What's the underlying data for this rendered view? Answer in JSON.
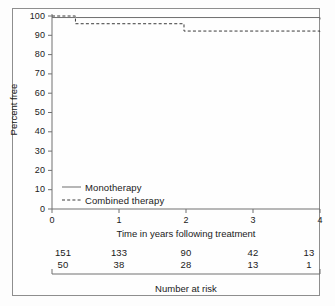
{
  "figure": {
    "caption_bottom": "Number at risk"
  },
  "chart_data": {
    "type": "line",
    "subtype": "kaplan-meier-step",
    "title": "",
    "xlabel": "Time in years following treatment",
    "ylabel": "Percent free",
    "xlim": [
      0,
      4
    ],
    "ylim": [
      0,
      100
    ],
    "xticks": [
      "0",
      "1",
      "2",
      "3",
      "4"
    ],
    "yticks": [
      "0",
      "10",
      "20",
      "30",
      "40",
      "50",
      "60",
      "70",
      "80",
      "90",
      "100"
    ],
    "grid": false,
    "legend_position": "inside-lower-left",
    "series": [
      {
        "name": "Monotherapy",
        "style": "solid",
        "color": "#6f6f6f",
        "steps_x": [
          0,
          0.35,
          4
        ],
        "steps_y": [
          99.2,
          99.2,
          98.2
        ]
      },
      {
        "name": "Combined therapy",
        "style": "dashed",
        "color": "#3a3a3a",
        "steps_x": [
          0,
          0.35,
          1.97,
          4
        ],
        "steps_y": [
          100,
          96.0,
          92.2,
          92.0
        ]
      }
    ],
    "risk_table": {
      "times": [
        "0",
        "1",
        "2",
        "3",
        "4"
      ],
      "rows": [
        {
          "series": "Monotherapy",
          "values": [
            "151",
            "133",
            "90",
            "42",
            "13"
          ]
        },
        {
          "series": "Combined therapy",
          "values": [
            "50",
            "38",
            "28",
            "13",
            "1"
          ]
        }
      ]
    }
  }
}
